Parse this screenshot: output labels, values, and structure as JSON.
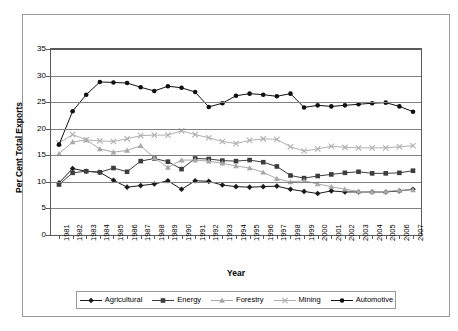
{
  "chart_data": {
    "type": "line",
    "title": "",
    "xlabel": "Year",
    "ylabel": "Per Cent Total Exports",
    "ylim": [
      0,
      35
    ],
    "yticks": [
      0,
      5,
      10,
      15,
      20,
      25,
      30,
      35
    ],
    "grid": true,
    "legend_position": "bottom",
    "categories": [
      1981,
      1982,
      1983,
      1984,
      1985,
      1986,
      1987,
      1988,
      1989,
      1990,
      1991,
      1992,
      1993,
      1994,
      1995,
      1996,
      1997,
      1998,
      1999,
      2000,
      2001,
      2002,
      2003,
      2004,
      2005,
      2006,
      2007
    ],
    "series": [
      {
        "name": "Agricultural",
        "marker": "diamond",
        "color": "#1a1a1a",
        "values": [
          9.8,
          12.5,
          12.0,
          11.8,
          10.3,
          9.0,
          9.3,
          9.6,
          10.2,
          8.6,
          10.2,
          10.1,
          9.4,
          9.1,
          9.0,
          9.1,
          9.2,
          8.6,
          8.2,
          7.8,
          8.3,
          8.1,
          8.1,
          8.1,
          8.1,
          8.3,
          8.6
        ]
      },
      {
        "name": "Energy",
        "marker": "square",
        "color": "#3d3d3d",
        "values": [
          9.5,
          11.7,
          12.0,
          11.8,
          12.6,
          11.9,
          13.9,
          14.4,
          13.8,
          12.4,
          14.4,
          14.3,
          14.0,
          13.9,
          14.1,
          13.7,
          12.9,
          11.2,
          10.7,
          11.1,
          11.4,
          11.7,
          11.9,
          11.6,
          11.6,
          11.7,
          12.1
        ]
      },
      {
        "name": "Forestry",
        "marker": "triangle",
        "color": "#a8a8a8",
        "values": [
          15.3,
          17.5,
          17.9,
          16.2,
          15.6,
          15.9,
          16.8,
          14.5,
          12.7,
          14.1,
          14.1,
          13.9,
          13.5,
          13.0,
          12.6,
          11.8,
          10.6,
          10.0,
          10.2,
          9.6,
          9.1,
          8.6,
          8.2,
          8.1,
          8.2,
          8.4,
          8.5
        ]
      },
      {
        "name": "Mining",
        "marker": "cross",
        "color": "#b0b0b0",
        "values": [
          17.3,
          18.9,
          17.9,
          17.7,
          17.6,
          18.1,
          18.7,
          18.8,
          18.8,
          19.6,
          18.9,
          18.3,
          17.6,
          17.2,
          17.8,
          18.1,
          18.0,
          16.6,
          15.8,
          16.2,
          16.7,
          16.5,
          16.4,
          16.4,
          16.4,
          16.6,
          16.8
        ]
      },
      {
        "name": "Automotive",
        "marker": "circle",
        "color": "#111111",
        "values": [
          17.0,
          23.3,
          26.4,
          28.8,
          28.7,
          28.6,
          27.8,
          27.1,
          28.0,
          27.7,
          26.9,
          24.1,
          24.8,
          26.2,
          26.6,
          26.4,
          26.1,
          26.6,
          24.0,
          24.4,
          24.2,
          24.4,
          24.6,
          24.8,
          24.9,
          24.2,
          23.2
        ]
      }
    ]
  },
  "legend": {
    "items": [
      {
        "label": "Agricultural"
      },
      {
        "label": "Energy"
      },
      {
        "label": "Forestry"
      },
      {
        "label": "Mining"
      },
      {
        "label": "Automotive"
      }
    ]
  }
}
